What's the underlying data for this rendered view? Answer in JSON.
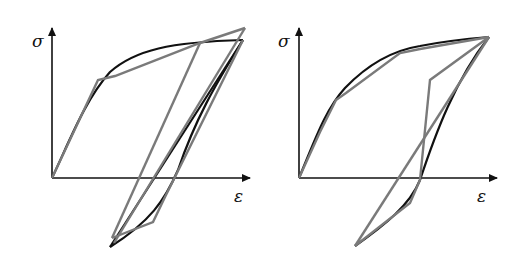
{
  "figure": {
    "colors": {
      "smooth_curve": "#111111",
      "piecewise_curve": "#7a7a7a",
      "axes": "#111111"
    },
    "panels": [
      {
        "id": "left",
        "y_axis_label": "σ",
        "x_axis_label": "ε"
      },
      {
        "id": "right",
        "y_axis_label": "σ",
        "x_axis_label": "ε"
      }
    ]
  }
}
